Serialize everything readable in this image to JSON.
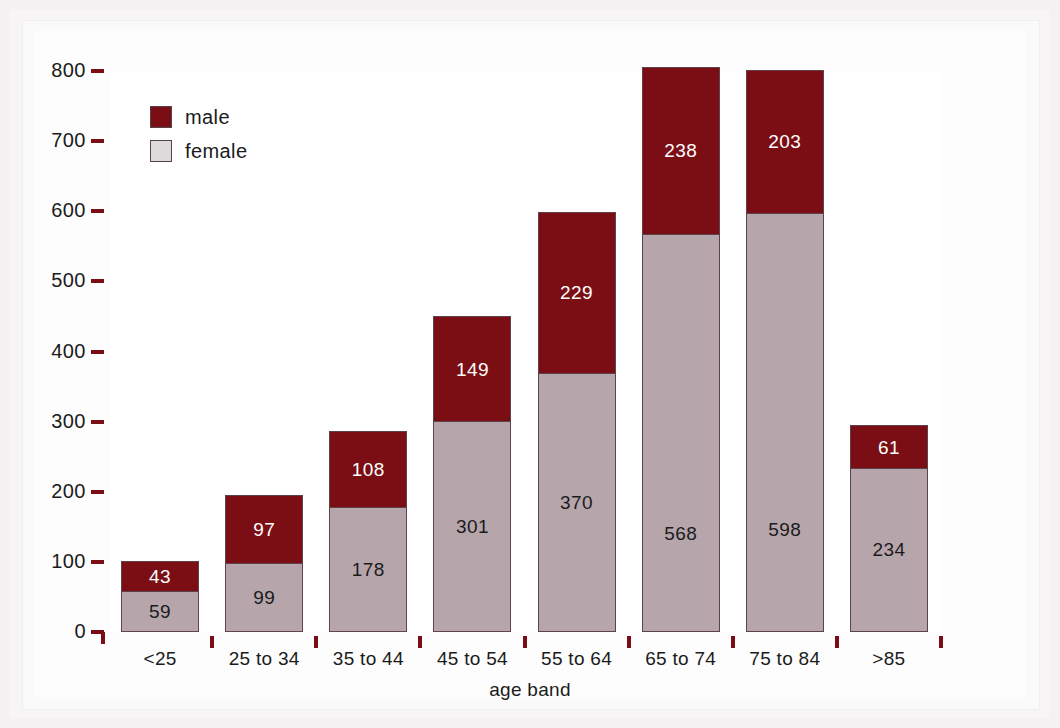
{
  "chart_data": {
    "type": "bar",
    "subtype": "stacked-vertical",
    "title": "",
    "xlabel": "age band",
    "ylabel": "",
    "categories": [
      "<25",
      "25 to 34",
      "35 to 44",
      "45 to 54",
      "55 to 64",
      "65 to 74",
      "75 to 84",
      ">85"
    ],
    "series": [
      {
        "name": "female",
        "color": "#b7a5ac",
        "values": [
          59,
          99,
          178,
          301,
          370,
          568,
          598,
          234
        ]
      },
      {
        "name": "male",
        "color": "#7b0e14",
        "values": [
          43,
          97,
          108,
          149,
          229,
          238,
          203,
          61
        ]
      }
    ],
    "stack_order": [
      "female",
      "male"
    ],
    "totals": [
      102,
      196,
      286,
      450,
      599,
      806,
      801,
      295
    ],
    "ylim": [
      0,
      800
    ],
    "ytick_values": [
      0,
      100,
      200,
      300,
      400,
      500,
      600,
      700,
      800
    ],
    "ytick_labels": [
      "0",
      "100",
      "200",
      "300",
      "400",
      "500",
      "600",
      "700",
      "800"
    ],
    "grid": false,
    "legend_position": "top-left",
    "legend_entries": [
      "male",
      "female"
    ],
    "data_labels": true
  },
  "legend": {
    "items": [
      {
        "label": "male",
        "swatch": "male"
      },
      {
        "label": "female",
        "swatch": "female"
      }
    ]
  },
  "colors": {
    "male": "#7b0e14",
    "female": "#b7a5ac",
    "tick": "#7b0e14",
    "text": "#1b1b1b",
    "plot_background": "#ffffff",
    "figure_background": "#f3f1f1"
  }
}
